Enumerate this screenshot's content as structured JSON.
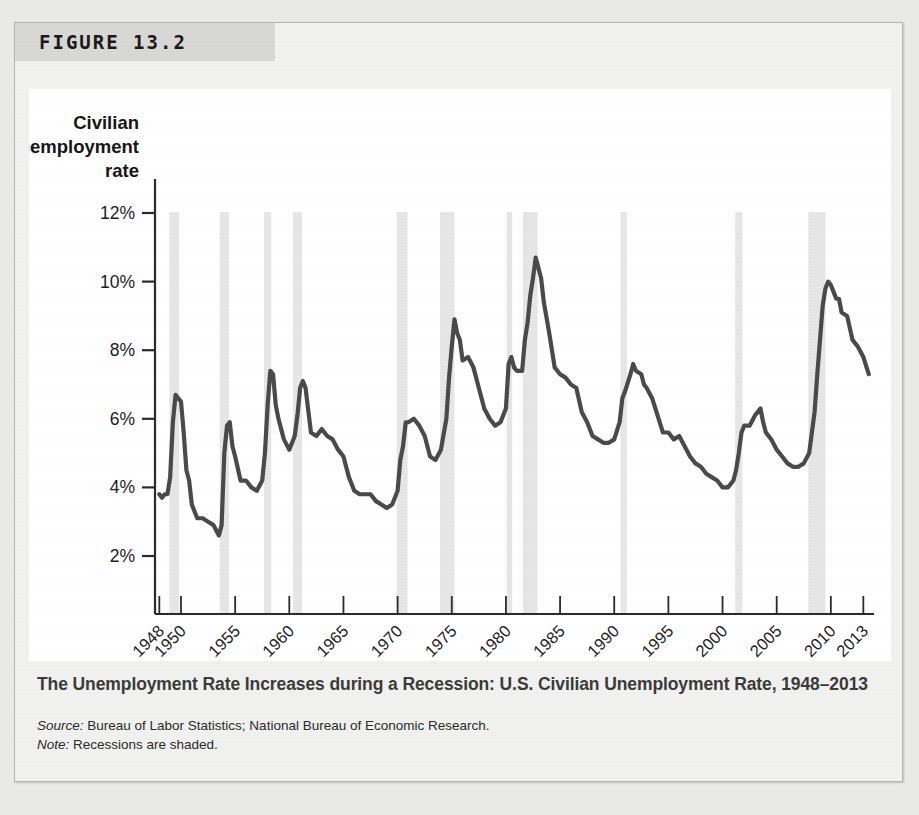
{
  "figure": {
    "label": "FIGURE 13.2",
    "caption_title": "The Unemployment Rate Increases during a Recession: U.S. Civilian Unemployment Rate, 1948–2013",
    "source_prefix": "Source:",
    "source_text": " Bureau of Labor Statistics; National Bureau of Economic Research.",
    "note_prefix": "Note:",
    "note_text": " Recessions are shaded."
  },
  "colors": {
    "line": "#4a4a4a",
    "recession_band": "#e6e6e6",
    "axis": "#2b2b2b",
    "header_band": "#d8d8d6",
    "card_bg": "#f1f1ef",
    "plot_bg": "#ffffff",
    "caption_text": "#3b3b3b"
  },
  "chart_data": {
    "type": "line",
    "title": "Civilian unemployment rate",
    "xlabel": "Year",
    "ylabel": "Civilian unemployment rate",
    "ylim": [
      1.2,
      12.6
    ],
    "xlim": [
      1947.6,
      2013.8
    ],
    "grid": false,
    "legend": "none",
    "ytick_labels": [
      "2%",
      "4%",
      "6%",
      "8%",
      "10%",
      "12%"
    ],
    "ytick_values": [
      2,
      4,
      6,
      8,
      10,
      12
    ],
    "xtick_labels": [
      "1948",
      "1950",
      "1955",
      "1960",
      "1965",
      "1970",
      "1975",
      "1980",
      "1985",
      "1990",
      "1995",
      "2000",
      "2005",
      "2010",
      "2013"
    ],
    "xtick_values": [
      1948,
      1950,
      1955,
      1960,
      1965,
      1970,
      1975,
      1980,
      1985,
      1990,
      1995,
      2000,
      2005,
      2010,
      2013
    ],
    "series": [
      {
        "name": "Civilian unemployment rate",
        "x": [
          1948.0,
          1948.25,
          1948.5,
          1948.75,
          1949.0,
          1949.25,
          1949.5,
          1949.75,
          1950.0,
          1950.25,
          1950.5,
          1950.75,
          1951.0,
          1951.5,
          1952.0,
          1952.5,
          1953.0,
          1953.5,
          1953.75,
          1954.0,
          1954.25,
          1954.5,
          1954.75,
          1955.0,
          1955.5,
          1956.0,
          1956.5,
          1957.0,
          1957.5,
          1957.75,
          1958.0,
          1958.25,
          1958.5,
          1958.75,
          1959.0,
          1959.5,
          1960.0,
          1960.5,
          1960.75,
          1961.0,
          1961.25,
          1961.5,
          1962.0,
          1962.5,
          1963.0,
          1963.5,
          1964.0,
          1964.5,
          1965.0,
          1965.5,
          1966.0,
          1966.5,
          1967.0,
          1967.5,
          1968.0,
          1968.5,
          1969.0,
          1969.5,
          1970.0,
          1970.25,
          1970.5,
          1970.75,
          1971.0,
          1971.5,
          1972.0,
          1972.5,
          1973.0,
          1973.5,
          1974.0,
          1974.5,
          1974.75,
          1975.0,
          1975.25,
          1975.5,
          1975.75,
          1976.0,
          1976.5,
          1977.0,
          1977.5,
          1978.0,
          1978.5,
          1979.0,
          1979.5,
          1980.0,
          1980.25,
          1980.5,
          1980.75,
          1981.0,
          1981.5,
          1981.75,
          1982.0,
          1982.25,
          1982.5,
          1982.75,
          1983.0,
          1983.25,
          1983.5,
          1984.0,
          1984.5,
          1985.0,
          1985.5,
          1986.0,
          1986.5,
          1987.0,
          1987.5,
          1988.0,
          1988.5,
          1989.0,
          1989.5,
          1990.0,
          1990.5,
          1990.75,
          1991.0,
          1991.5,
          1991.75,
          1992.0,
          1992.5,
          1992.75,
          1993.0,
          1993.5,
          1994.0,
          1994.5,
          1995.0,
          1995.5,
          1996.0,
          1996.5,
          1997.0,
          1997.5,
          1998.0,
          1998.5,
          1999.0,
          1999.5,
          2000.0,
          2000.5,
          2001.0,
          2001.25,
          2001.5,
          2001.75,
          2002.0,
          2002.5,
          2003.0,
          2003.5,
          2003.75,
          2004.0,
          2004.5,
          2005.0,
          2005.5,
          2006.0,
          2006.5,
          2007.0,
          2007.5,
          2008.0,
          2008.25,
          2008.5,
          2008.75,
          2009.0,
          2009.25,
          2009.5,
          2009.75,
          2010.0,
          2010.25,
          2010.5,
          2010.75,
          2011.0,
          2011.5,
          2012.0,
          2012.5,
          2013.0,
          2013.5
        ],
        "y": [
          3.8,
          3.7,
          3.8,
          3.8,
          4.3,
          5.9,
          6.7,
          6.6,
          6.5,
          5.6,
          4.5,
          4.2,
          3.5,
          3.1,
          3.1,
          3.0,
          2.9,
          2.6,
          2.9,
          5.0,
          5.8,
          5.9,
          5.2,
          4.9,
          4.2,
          4.2,
          4.0,
          3.9,
          4.2,
          5.0,
          6.4,
          7.4,
          7.3,
          6.4,
          6.0,
          5.4,
          5.1,
          5.5,
          6.1,
          6.9,
          7.1,
          6.9,
          5.6,
          5.5,
          5.7,
          5.5,
          5.4,
          5.1,
          4.9,
          4.3,
          3.9,
          3.8,
          3.8,
          3.8,
          3.6,
          3.5,
          3.4,
          3.5,
          3.9,
          4.8,
          5.2,
          5.9,
          5.9,
          6.0,
          5.8,
          5.5,
          4.9,
          4.8,
          5.1,
          6.0,
          7.2,
          8.1,
          8.9,
          8.5,
          8.3,
          7.7,
          7.8,
          7.5,
          6.9,
          6.3,
          6.0,
          5.8,
          5.9,
          6.3,
          7.6,
          7.8,
          7.5,
          7.4,
          7.4,
          8.3,
          8.8,
          9.6,
          10.1,
          10.7,
          10.4,
          10.1,
          9.4,
          8.5,
          7.5,
          7.3,
          7.2,
          7.0,
          6.9,
          6.2,
          5.9,
          5.5,
          5.4,
          5.3,
          5.3,
          5.4,
          5.9,
          6.6,
          6.8,
          7.3,
          7.6,
          7.4,
          7.3,
          7.0,
          6.9,
          6.6,
          6.1,
          5.6,
          5.6,
          5.4,
          5.5,
          5.2,
          4.9,
          4.7,
          4.6,
          4.4,
          4.3,
          4.2,
          4.0,
          4.0,
          4.2,
          4.5,
          5.0,
          5.6,
          5.8,
          5.8,
          6.1,
          6.3,
          5.9,
          5.6,
          5.4,
          5.1,
          4.9,
          4.7,
          4.6,
          4.6,
          4.7,
          5.0,
          5.6,
          6.2,
          7.3,
          8.3,
          9.3,
          9.8,
          10.0,
          9.9,
          9.7,
          9.5,
          9.5,
          9.1,
          9.0,
          8.3,
          8.1,
          7.8,
          7.3
        ]
      }
    ],
    "recessions": [
      {
        "start": 1948.92,
        "end": 1949.83
      },
      {
        "start": 1953.58,
        "end": 1954.42
      },
      {
        "start": 1957.67,
        "end": 1958.33
      },
      {
        "start": 1960.33,
        "end": 1961.17
      },
      {
        "start": 1969.92,
        "end": 1970.92
      },
      {
        "start": 1973.92,
        "end": 1975.25
      },
      {
        "start": 1980.08,
        "end": 1980.58
      },
      {
        "start": 1981.58,
        "end": 1982.92
      },
      {
        "start": 1990.58,
        "end": 1991.17
      },
      {
        "start": 2001.17,
        "end": 2001.83
      },
      {
        "start": 2007.92,
        "end": 2009.5
      }
    ]
  }
}
